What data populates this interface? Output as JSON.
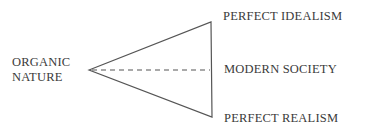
{
  "diagram": {
    "left_label": {
      "line1": "ORGANIC",
      "line2": "NATURE"
    },
    "right_labels": {
      "top": "PERFECT IDEALISM",
      "middle": "MODERN SOCIETY",
      "bottom": "PERFECT REALISM"
    },
    "shape": "triangle-with-dashed-axis",
    "stroke_color": "#555555"
  }
}
